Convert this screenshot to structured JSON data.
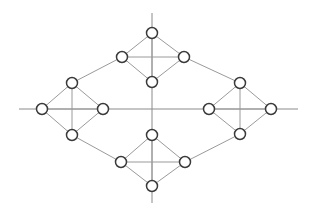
{
  "diagram": {
    "type": "graph",
    "colors": {
      "background": "#ffffff",
      "node_fill": "#ffffff",
      "node_stroke": "#3a3a3a",
      "edge": "#9a9a9a",
      "axis": "#8a8a8a"
    },
    "node_radius": 5.5,
    "axes": [
      {
        "id": "vertical-axis",
        "x1": 152,
        "y1": 13,
        "x2": 152,
        "y2": 203
      },
      {
        "id": "horizontal-axis",
        "x1": 19,
        "y1": 109,
        "x2": 298,
        "y2": 109
      }
    ],
    "nodes": [
      {
        "id": "top-t",
        "x": 152,
        "y": 33
      },
      {
        "id": "top-l",
        "x": 122,
        "y": 57
      },
      {
        "id": "top-r",
        "x": 184,
        "y": 57
      },
      {
        "id": "top-b",
        "x": 152,
        "y": 82
      },
      {
        "id": "left-t",
        "x": 72,
        "y": 83
      },
      {
        "id": "left-l",
        "x": 42,
        "y": 109
      },
      {
        "id": "left-r",
        "x": 103,
        "y": 109
      },
      {
        "id": "left-b",
        "x": 72,
        "y": 135
      },
      {
        "id": "right-t",
        "x": 240,
        "y": 83
      },
      {
        "id": "right-l",
        "x": 209,
        "y": 109
      },
      {
        "id": "right-r",
        "x": 271,
        "y": 109
      },
      {
        "id": "right-b",
        "x": 240,
        "y": 134
      },
      {
        "id": "bottom-t",
        "x": 152,
        "y": 135
      },
      {
        "id": "bottom-l",
        "x": 121,
        "y": 162
      },
      {
        "id": "bottom-r",
        "x": 185,
        "y": 162
      },
      {
        "id": "bottom-b",
        "x": 152,
        "y": 186
      }
    ],
    "edges": [
      [
        "top-t",
        "top-l"
      ],
      [
        "top-t",
        "top-r"
      ],
      [
        "top-l",
        "top-b"
      ],
      [
        "top-r",
        "top-b"
      ],
      [
        "top-l",
        "top-r"
      ],
      [
        "top-t",
        "top-b"
      ],
      [
        "left-t",
        "left-l"
      ],
      [
        "left-t",
        "left-r"
      ],
      [
        "left-l",
        "left-b"
      ],
      [
        "left-r",
        "left-b"
      ],
      [
        "left-l",
        "left-r"
      ],
      [
        "left-t",
        "left-b"
      ],
      [
        "right-t",
        "right-l"
      ],
      [
        "right-t",
        "right-r"
      ],
      [
        "right-l",
        "right-b"
      ],
      [
        "right-r",
        "right-b"
      ],
      [
        "right-l",
        "right-r"
      ],
      [
        "right-t",
        "right-b"
      ],
      [
        "bottom-t",
        "bottom-l"
      ],
      [
        "bottom-t",
        "bottom-r"
      ],
      [
        "bottom-l",
        "bottom-b"
      ],
      [
        "bottom-r",
        "bottom-b"
      ],
      [
        "bottom-l",
        "bottom-r"
      ],
      [
        "bottom-t",
        "bottom-b"
      ],
      [
        "top-l",
        "left-t"
      ],
      [
        "top-r",
        "right-t"
      ],
      [
        "left-b",
        "bottom-l"
      ],
      [
        "right-b",
        "bottom-r"
      ]
    ]
  }
}
